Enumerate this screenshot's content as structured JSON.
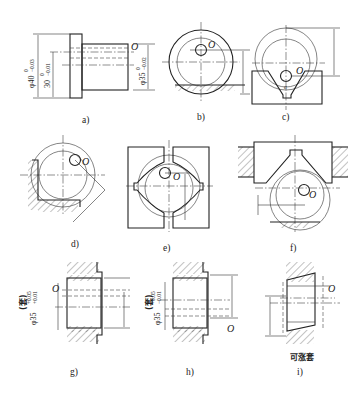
{
  "figure": {
    "panels": [
      {
        "id": "a",
        "label": "a)",
        "origin_label": "O",
        "dims": [
          "φ40 0/-0.03",
          "30 0/-0.01",
          "φ35 0/-0.02"
        ]
      },
      {
        "id": "b",
        "label": "b)",
        "origin_label": "O"
      },
      {
        "id": "c",
        "label": "c)",
        "origin_label": "O",
        "angle_label": "α"
      },
      {
        "id": "d",
        "label": "d)",
        "origin_label": "O"
      },
      {
        "id": "e",
        "label": "e)",
        "origin_label": "O"
      },
      {
        "id": "f",
        "label": "f)",
        "origin_label": "O"
      },
      {
        "id": "g",
        "label": "g)",
        "origin_label": "O",
        "dims": [
          "(套) φ35 +0.05/+0.01"
        ]
      },
      {
        "id": "h",
        "label": "h)",
        "origin_label": "O",
        "dims": [
          "(套) φ35 +0.05/-0.01"
        ]
      },
      {
        "id": "i",
        "label": "i)",
        "origin_label": "O",
        "caption": "可涨套"
      }
    ]
  },
  "text": {
    "a_label": "a)",
    "b_label": "b)",
    "c_label": "c)",
    "d_label": "d)",
    "e_label": "e)",
    "f_label": "f)",
    "g_label": "g)",
    "h_label": "h)",
    "i_label": "i)",
    "origin": "O",
    "alpha": "α",
    "a_dim1_main": "φ40",
    "a_dim1_tol_up": "0",
    "a_dim1_tol_lo": "−0.03",
    "a_dim2_main": "30",
    "a_dim2_tol_up": "0",
    "a_dim2_tol_lo": "−0.01",
    "a_dim3_main": "φ35",
    "a_dim3_tol_up": "0",
    "a_dim3_tol_lo": "−0.02",
    "g_dim_prefix": "(套)",
    "g_dim_main": "φ35",
    "g_tol_up": "+0.05",
    "g_tol_lo": "+0.01",
    "h_dim_prefix": "(套)",
    "h_dim_main": "φ35",
    "h_tol_up": "+0.05",
    "h_tol_lo": "−0.01",
    "i_caption": "可涨套"
  }
}
